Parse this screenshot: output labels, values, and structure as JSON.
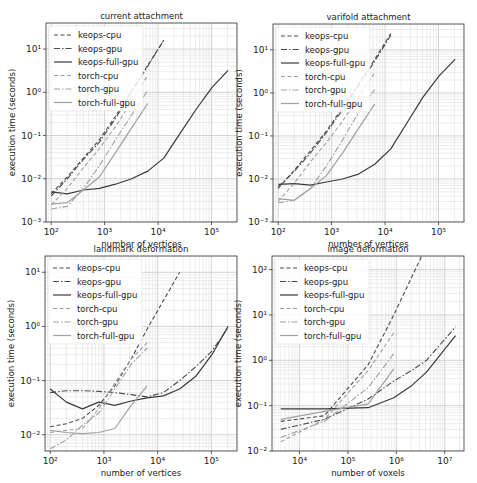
{
  "figure": {
    "width": 477,
    "height": 483
  },
  "styles": {
    "keops-cpu": {
      "color": "#4a4a4a",
      "dash": "4,2.5",
      "width": 1.1
    },
    "keops-gpu": {
      "color": "#4a4a4a",
      "dash": "6,2,1.5,2",
      "width": 1.1
    },
    "keops-full-gpu": {
      "color": "#3a3a3a",
      "dash": "",
      "width": 1.2
    },
    "torch-cpu": {
      "color": "#a0a0a0",
      "dash": "4,2.5",
      "width": 1.1
    },
    "torch-gpu": {
      "color": "#a0a0a0",
      "dash": "6,2,1.5,2",
      "width": 1.1
    },
    "torch-full-gpu": {
      "color": "#a0a0a0",
      "dash": "",
      "width": 1.2
    }
  },
  "chart_data": [
    {
      "type": "line",
      "title": "current attachment",
      "xlabel": "number of vertices",
      "ylabel": "execution time (seconds)",
      "xscale": "log",
      "yscale": "log",
      "xlim": [
        80,
        300000
      ],
      "ylim": [
        0.001,
        40
      ],
      "xticks": [
        {
          "v": 100,
          "label": "10²"
        },
        {
          "v": 1000,
          "label": "10³"
        },
        {
          "v": 10000,
          "label": "10⁴"
        },
        {
          "v": 100000,
          "label": "10⁵"
        }
      ],
      "yticks": [
        {
          "v": 0.001,
          "label": "10⁻³"
        },
        {
          "v": 0.01,
          "label": "10⁻²"
        },
        {
          "v": 0.1,
          "label": "10⁻¹"
        },
        {
          "v": 1,
          "label": "10⁰"
        },
        {
          "v": 10,
          "label": "10¹"
        }
      ],
      "grid": true,
      "legend_position": "upper left",
      "box": {
        "x0": 46,
        "y0": 23,
        "x1": 237,
        "y1": 222
      },
      "series": [
        {
          "name": "keops-cpu",
          "x": [
            100,
            200,
            400,
            800,
            1600,
            3200,
            6400,
            12800
          ],
          "y": [
            0.0045,
            0.011,
            0.03,
            0.08,
            0.28,
            1.1,
            4.2,
            16
          ]
        },
        {
          "name": "keops-gpu",
          "x": [
            100,
            200,
            400,
            800,
            1600,
            3200,
            6400,
            12800
          ],
          "y": [
            0.004,
            0.01,
            0.028,
            0.07,
            0.25,
            1.0,
            4.0,
            16
          ]
        },
        {
          "name": "keops-full-gpu",
          "x": [
            100,
            200,
            400,
            800,
            1600,
            3200,
            6400,
            12800,
            25600,
            51200,
            102400,
            204800
          ],
          "y": [
            0.005,
            0.0045,
            0.0055,
            0.006,
            0.0075,
            0.01,
            0.015,
            0.03,
            0.11,
            0.4,
            1.3,
            3.2
          ]
        },
        {
          "name": "torch-cpu",
          "x": [
            100,
            200,
            400,
            800,
            1600,
            3200,
            6400
          ],
          "y": [
            0.0025,
            0.006,
            0.018,
            0.05,
            0.16,
            0.6,
            2.5
          ]
        },
        {
          "name": "torch-gpu",
          "x": [
            100,
            200,
            400,
            800,
            1600,
            3200,
            6400
          ],
          "y": [
            0.002,
            0.0023,
            0.006,
            0.02,
            0.08,
            0.3,
            1.1
          ]
        },
        {
          "name": "torch-full-gpu",
          "x": [
            100,
            200,
            400,
            800,
            1600,
            3200,
            6400
          ],
          "y": [
            0.0026,
            0.0028,
            0.0055,
            0.011,
            0.04,
            0.15,
            0.55
          ]
        }
      ]
    },
    {
      "type": "line",
      "title": "varifold attachment",
      "xlabel": "number of vertices",
      "ylabel": "execution time (seconds)",
      "xscale": "log",
      "yscale": "log",
      "xlim": [
        80,
        300000
      ],
      "ylim": [
        0.001,
        40
      ],
      "xticks": [
        {
          "v": 100,
          "label": "10²"
        },
        {
          "v": 1000,
          "label": "10³"
        },
        {
          "v": 10000,
          "label": "10⁴"
        },
        {
          "v": 100000,
          "label": "10⁵"
        }
      ],
      "yticks": [
        {
          "v": 0.001,
          "label": "10⁻³"
        },
        {
          "v": 0.01,
          "label": "10⁻²"
        },
        {
          "v": 0.1,
          "label": "10⁻¹"
        },
        {
          "v": 1,
          "label": "10⁰"
        },
        {
          "v": 10,
          "label": "10¹"
        }
      ],
      "grid": true,
      "legend_position": "upper left",
      "box": {
        "x0": 273,
        "y0": 24,
        "x1": 464,
        "y1": 222
      },
      "series": [
        {
          "name": "keops-cpu",
          "x": [
            100,
            200,
            400,
            800,
            1600,
            3200,
            6400,
            12800
          ],
          "y": [
            0.006,
            0.016,
            0.045,
            0.13,
            0.45,
            1.6,
            6,
            24
          ]
        },
        {
          "name": "keops-gpu",
          "x": [
            100,
            200,
            400,
            800,
            1600,
            3200,
            6400,
            12800
          ],
          "y": [
            0.0065,
            0.015,
            0.04,
            0.12,
            0.4,
            1.5,
            5.5,
            22
          ]
        },
        {
          "name": "keops-full-gpu",
          "x": [
            100,
            200,
            400,
            800,
            1600,
            3200,
            6400,
            12800,
            25600,
            51200,
            102400,
            204800
          ],
          "y": [
            0.0075,
            0.0078,
            0.0072,
            0.0085,
            0.01,
            0.013,
            0.022,
            0.05,
            0.2,
            0.8,
            2.5,
            6
          ]
        },
        {
          "name": "torch-cpu",
          "x": [
            100,
            200,
            400,
            800,
            1600,
            3200,
            6400
          ],
          "y": [
            0.003,
            0.008,
            0.025,
            0.07,
            0.22,
            0.8,
            3
          ]
        },
        {
          "name": "torch-gpu",
          "x": [
            100,
            200,
            400,
            800,
            1600,
            3200,
            6400
          ],
          "y": [
            0.0028,
            0.0032,
            0.006,
            0.02,
            0.08,
            0.35,
            1.2
          ]
        },
        {
          "name": "torch-full-gpu",
          "x": [
            100,
            200,
            400,
            800,
            1600,
            3200,
            6400
          ],
          "y": [
            0.0035,
            0.0032,
            0.006,
            0.012,
            0.04,
            0.15,
            0.55
          ]
        }
      ]
    },
    {
      "type": "line",
      "title": "landmark deformation",
      "xlabel": "number of vertices",
      "ylabel": "execution time (seconds)",
      "xscale": "log",
      "yscale": "log",
      "xlim": [
        80,
        300000
      ],
      "ylim": [
        0.005,
        20
      ],
      "xticks": [
        {
          "v": 100,
          "label": "10²"
        },
        {
          "v": 1000,
          "label": "10³"
        },
        {
          "v": 10000,
          "label": "10⁴"
        },
        {
          "v": 100000,
          "label": "10⁵"
        }
      ],
      "yticks": [
        {
          "v": 0.01,
          "label": "10⁻²"
        },
        {
          "v": 0.1,
          "label": "10⁻¹"
        },
        {
          "v": 1,
          "label": "10⁰"
        },
        {
          "v": 10,
          "label": "10¹"
        }
      ],
      "grid": true,
      "legend_position": "upper left",
      "box": {
        "x0": 45,
        "y0": 256,
        "x1": 237,
        "y1": 451
      },
      "series": [
        {
          "name": "keops-cpu",
          "x": [
            100,
            200,
            400,
            800,
            1600,
            3200,
            6400,
            12800,
            25600
          ],
          "y": [
            0.014,
            0.016,
            0.02,
            0.035,
            0.08,
            0.25,
            0.9,
            3,
            10
          ]
        },
        {
          "name": "keops-gpu",
          "x": [
            100,
            200,
            400,
            800,
            1600,
            3200,
            6400,
            12800,
            25600,
            51200,
            102400,
            204800
          ],
          "y": [
            0.06,
            0.065,
            0.065,
            0.063,
            0.06,
            0.055,
            0.05,
            0.06,
            0.1,
            0.18,
            0.35,
            0.95
          ]
        },
        {
          "name": "keops-full-gpu",
          "x": [
            100,
            200,
            400,
            800,
            1600,
            3200,
            6400,
            12800,
            25600,
            51200,
            102400,
            204800
          ],
          "y": [
            0.07,
            0.04,
            0.03,
            0.04,
            0.035,
            0.042,
            0.048,
            0.052,
            0.07,
            0.12,
            0.3,
            1.0
          ]
        },
        {
          "name": "torch-cpu",
          "x": [
            100,
            200,
            400,
            800,
            1600,
            3200,
            6400
          ],
          "y": [
            0.011,
            0.012,
            0.013,
            0.03,
            0.09,
            0.25,
            0.5
          ]
        },
        {
          "name": "torch-gpu",
          "x": [
            100,
            200,
            400,
            800,
            1600,
            3200,
            6400
          ],
          "y": [
            0.0055,
            0.008,
            0.015,
            0.025,
            0.07,
            0.2,
            0.4
          ]
        },
        {
          "name": "torch-full-gpu",
          "x": [
            100,
            200,
            400,
            800,
            1600,
            3200,
            6400
          ],
          "y": [
            0.012,
            0.011,
            0.0105,
            0.011,
            0.013,
            0.035,
            0.08
          ]
        }
      ]
    },
    {
      "type": "line",
      "title": "image deformation",
      "xlabel": "number of voxels",
      "ylabel": "execution time (seconds)",
      "xscale": "log",
      "yscale": "log",
      "xlim": [
        2700,
        25000000
      ],
      "ylim": [
        0.01,
        200
      ],
      "xticks": [
        {
          "v": 10000,
          "label": "10⁴"
        },
        {
          "v": 100000,
          "label": "10⁵"
        },
        {
          "v": 1000000,
          "label": "10⁶"
        },
        {
          "v": 10000000,
          "label": "10⁷"
        }
      ],
      "yticks": [
        {
          "v": 0.01,
          "label": "10⁻²"
        },
        {
          "v": 0.1,
          "label": "10⁻¹"
        },
        {
          "v": 1,
          "label": "10⁰"
        },
        {
          "v": 10,
          "label": "10¹"
        },
        {
          "v": 100,
          "label": "10²"
        }
      ],
      "grid": true,
      "legend_position": "upper left",
      "box": {
        "x0": 272,
        "y0": 256,
        "x1": 464,
        "y1": 451
      },
      "series": [
        {
          "name": "keops-cpu",
          "x": [
            4096,
            32768,
            262144,
            884736,
            2097152,
            4000000
          ],
          "y": [
            0.045,
            0.06,
            0.8,
            10,
            70,
            300
          ]
        },
        {
          "name": "keops-gpu",
          "x": [
            4096,
            32768,
            262144,
            884736,
            2097152,
            4194304,
            16777216
          ],
          "y": [
            0.03,
            0.05,
            0.14,
            0.35,
            0.6,
            1.0,
            5.5
          ]
        },
        {
          "name": "keops-full-gpu",
          "x": [
            4096,
            32768,
            262144,
            884736,
            2097152,
            4194304,
            16777216
          ],
          "y": [
            0.085,
            0.085,
            0.09,
            0.15,
            0.28,
            0.55,
            3.5
          ]
        },
        {
          "name": "torch-cpu",
          "x": [
            4096,
            32768,
            262144,
            884736
          ],
          "y": [
            0.016,
            0.05,
            0.6,
            4
          ]
        },
        {
          "name": "torch-gpu",
          "x": [
            4096,
            32768,
            262144,
            884736
          ],
          "y": [
            0.02,
            0.045,
            0.25,
            1.4
          ]
        },
        {
          "name": "torch-full-gpu",
          "x": [
            4096,
            32768,
            262144,
            884736
          ],
          "y": [
            0.05,
            0.075,
            0.11,
            0.65
          ]
        }
      ]
    }
  ]
}
